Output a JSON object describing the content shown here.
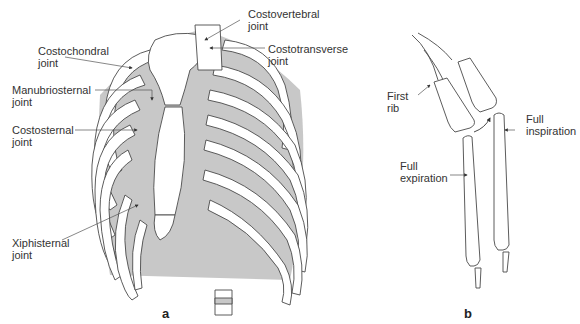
{
  "figure": {
    "panels": [
      {
        "id": "a",
        "letter": "a",
        "subject": "rib cage anterior view",
        "labels": [
          {
            "text": "Costovertebral\njoint",
            "name": "costovertebral-joint"
          },
          {
            "text": "Costochondral\njoint",
            "name": "costochondral-joint"
          },
          {
            "text": "Costotransverse\njoint",
            "name": "costotransverse-joint"
          },
          {
            "text": "Manubriosternal\njoint",
            "name": "manubriosternal-joint"
          },
          {
            "text": "Costosternal\njoint",
            "name": "costosternal-joint"
          },
          {
            "text": "Xiphisternal\njoint",
            "name": "xiphisternal-joint"
          }
        ]
      },
      {
        "id": "b",
        "letter": "b",
        "subject": "rib movement during breathing",
        "labels": [
          {
            "text": "First\nrib",
            "name": "first-rib"
          },
          {
            "text": "Full\ninspiration",
            "name": "full-inspiration"
          },
          {
            "text": "Full\nexpiration",
            "name": "full-expiration"
          }
        ]
      }
    ],
    "colors": {
      "line": "#4a4a4a",
      "shade": "#c8c8c8",
      "bone": "#ffffff"
    }
  }
}
